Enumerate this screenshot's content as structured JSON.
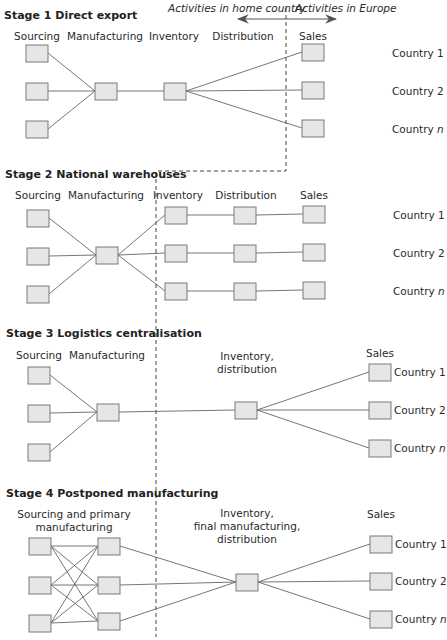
{
  "header": {
    "home_label": "Activities in home country",
    "europe_label": "Activities in Europe"
  },
  "colors": {
    "box_fill": "#e6e6e6",
    "box_stroke": "#7a7a7a",
    "line": "#555555",
    "dash": "#444444"
  },
  "countries": {
    "c1": "Country 1",
    "c2": "Country 2",
    "cn_prefix": "Country ",
    "cn_suffix": "n"
  },
  "stages": [
    {
      "title": "Stage 1  Direct export",
      "columns": [
        "Sourcing",
        "Manufacturing",
        "Inventory",
        "Distribution",
        "Sales"
      ]
    },
    {
      "title": "Stage 2  National warehouses",
      "columns": [
        "Sourcing",
        "Manufacturing",
        "Inventory",
        "Distribution",
        "Sales"
      ]
    },
    {
      "title": "Stage 3  Logistics centralisation",
      "columns": [
        "Sourcing",
        "Manufacturing",
        "Inventory,",
        "distribution",
        "Sales"
      ]
    },
    {
      "title": "Stage 4  Postponed manufacturing",
      "columns": [
        "Sourcing and primary",
        "manufacturing",
        "Inventory,",
        "final manufacturing,",
        "distribution",
        "Sales"
      ]
    }
  ]
}
